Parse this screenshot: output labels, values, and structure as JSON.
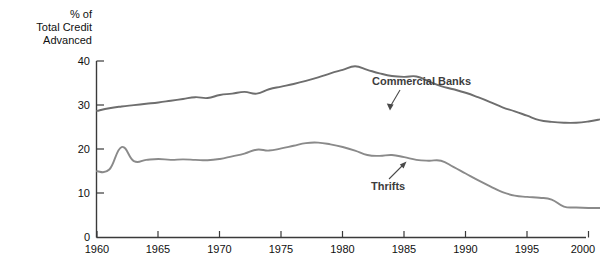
{
  "chart_data": {
    "type": "line",
    "title": "",
    "ylabel_lines": [
      "% of",
      "Total Credit",
      "Advanced"
    ],
    "xlabel": "",
    "xlim": [
      1960,
      2001
    ],
    "ylim": [
      0,
      40
    ],
    "grid": false,
    "legend_position": "inline-annotations",
    "y_ticks": [
      0,
      10,
      20,
      30,
      40
    ],
    "y_tick_labels": [
      "0",
      "10",
      "20",
      "30",
      "40"
    ],
    "x_ticks": [
      1960,
      1965,
      1970,
      1975,
      1980,
      1985,
      1990,
      1995,
      2000
    ],
    "x_tick_labels": [
      "1960",
      "1965",
      "1970",
      "1975",
      "1980",
      "1985",
      "1990",
      "1995",
      "2000"
    ],
    "series": [
      {
        "name": "Commercial Banks",
        "color": "#6e6e6e",
        "annotation": "Commercial Banks",
        "x": [
          1960,
          1961,
          1962,
          1963,
          1964,
          1965,
          1966,
          1967,
          1968,
          1969,
          1970,
          1971,
          1972,
          1973,
          1974,
          1975,
          1976,
          1977,
          1978,
          1979,
          1980,
          1981,
          1982,
          1983,
          1984,
          1985,
          1986,
          1987,
          1988,
          1989,
          1990,
          1991,
          1992,
          1993,
          1994,
          1995,
          1996,
          1997,
          1998,
          1999,
          2000,
          2001
        ],
        "values": [
          28.7,
          29.3,
          29.7,
          30.0,
          30.3,
          30.6,
          31.0,
          31.4,
          31.8,
          31.6,
          32.3,
          32.6,
          33.0,
          32.6,
          33.6,
          34.2,
          34.8,
          35.5,
          36.3,
          37.2,
          38.0,
          38.8,
          38.0,
          37.2,
          36.6,
          36.4,
          36.5,
          35.4,
          34.3,
          33.6,
          32.8,
          31.8,
          30.7,
          29.5,
          28.6,
          27.6,
          26.6,
          26.2,
          26.0,
          26.0,
          26.3,
          26.8
        ]
      },
      {
        "name": "Thrifts",
        "color": "#8a8a8a",
        "annotation": "Thrifts",
        "x": [
          1960,
          1961,
          1962,
          1963,
          1964,
          1965,
          1966,
          1967,
          1968,
          1969,
          1970,
          1971,
          1972,
          1973,
          1974,
          1975,
          1976,
          1977,
          1978,
          1979,
          1980,
          1981,
          1982,
          1983,
          1984,
          1985,
          1986,
          1987,
          1988,
          1989,
          1990,
          1991,
          1992,
          1993,
          1994,
          1995,
          1996,
          1997,
          1998,
          1999,
          2000,
          2001
        ],
        "values": [
          15.0,
          15.4,
          20.5,
          17.3,
          17.6,
          17.8,
          17.6,
          17.7,
          17.6,
          17.5,
          17.8,
          18.4,
          19.0,
          19.9,
          19.7,
          20.2,
          20.8,
          21.4,
          21.5,
          21.1,
          20.5,
          19.7,
          18.7,
          18.5,
          18.7,
          18.2,
          17.6,
          17.4,
          17.4,
          16.0,
          14.5,
          13.0,
          11.6,
          10.3,
          9.5,
          9.2,
          9.0,
          8.6,
          7.0,
          6.8,
          6.7,
          6.7
        ]
      }
    ]
  },
  "axis_geometry_note": "",
  "annotations": [
    {
      "label": "Commercial Banks",
      "target_year": 1987,
      "target_value": 34.0
    },
    {
      "label": "Thrifts",
      "target_year": 1988,
      "target_value": 17.4
    }
  ]
}
